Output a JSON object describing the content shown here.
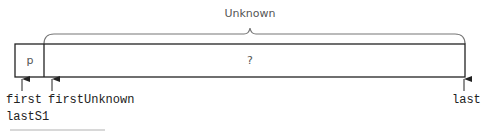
{
  "diagram": {
    "brace_label": "Unknown",
    "cells": [
      {
        "label": "p"
      },
      {
        "label": "?"
      }
    ],
    "pointers": [
      {
        "label": "first"
      },
      {
        "label": "lastS1"
      },
      {
        "label": "firstUnknown"
      },
      {
        "label": "last"
      }
    ],
    "colors": {
      "line": "#222222",
      "brace": "#777777",
      "text": "#555555"
    }
  }
}
